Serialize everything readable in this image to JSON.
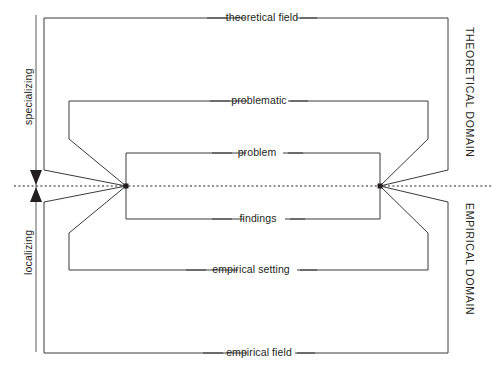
{
  "diagram": {
    "stroke_color": "#3a3a3a",
    "text_color": "#231f20",
    "background": "#ffffff",
    "axis": {
      "name": "specializing-localizing-axis",
      "upper_label": "specializing",
      "lower_label": "localizing"
    },
    "domains": {
      "theoretical": "THEORETICAL DOMAIN",
      "empirical": "EMPIRICAL DOMAIN"
    },
    "levels": [
      {
        "id": "theoretical-field",
        "label": "theoretical field"
      },
      {
        "id": "problematic",
        "label": "problematic"
      },
      {
        "id": "problem",
        "label": "problem"
      },
      {
        "id": "findings",
        "label": "findings"
      },
      {
        "id": "empirical-setting",
        "label": "empirical setting"
      },
      {
        "id": "empirical-field",
        "label": "empirical field"
      }
    ]
  }
}
